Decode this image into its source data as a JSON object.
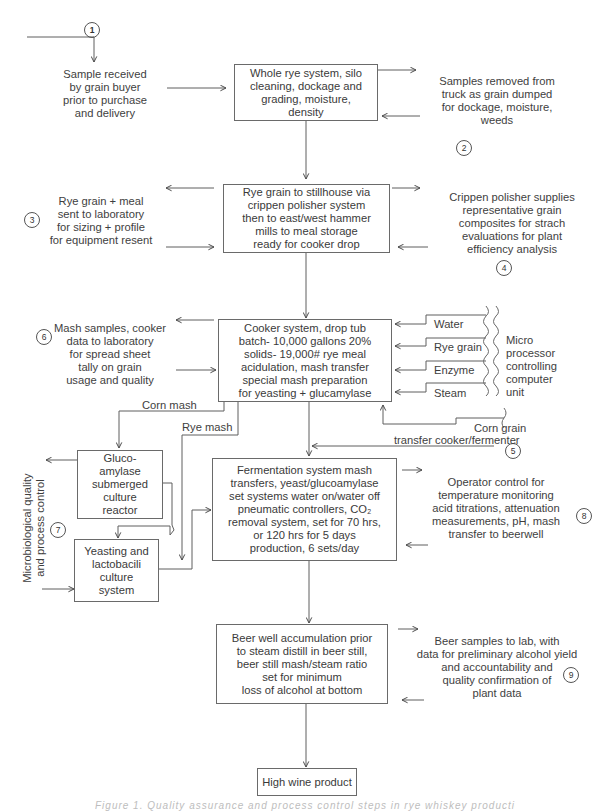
{
  "diagram": {
    "type": "process-flowchart",
    "markers": [
      "1",
      "2",
      "3",
      "4",
      "5",
      "6",
      "7",
      "8",
      "9"
    ],
    "boxes": {
      "whole_rye": "Whole rye system, silo\ncleaning, dockage and\ngrading, moisture,\ndensity",
      "rye_to_stillhouse": "Rye grain to stillhouse via\ncrippen polisher system\nthen to east/west hammer\nmills to meal storage\nready for cooker drop",
      "cooker": "Cooker system, drop tub\nbatch- 10,000 gallons 20%\nsolids- 19,000# rye meal\nacidulation, mash transfer\nspecial mash preparation\nfor yeasting + glucamylase",
      "glucoamylase": "Gluco-\namylase\nsubmerged\nculture\nreactor",
      "yeasting": "Yeasting and\nlactobacili\nculture\nsystem",
      "fermentation": "Fermentation system mash\ntransfers, yeast/glucoamylase\nset systems water on/water off\npneumatic controllers, CO₂\nremoval system, set for 70 hrs,\nor 120 hrs for 5 days\nproduction, 6 sets/day",
      "beer_well": "Beer well accumulation prior\nto steam distill in beer still,\nbeer still mash/steam ratio\nset for minimum\nloss of alcohol at bottom",
      "high_wine": "High wine product"
    },
    "notes": {
      "sample_received": "Sample received\nby grain buyer\nprior to purchase\nand delivery",
      "samples_removed": "Samples removed from\ntruck as grain dumped\nfor dockage, moisture,\nweeds",
      "rye_grain_meal": "Rye grain + meal\nsent to laboratory\nfor sizing + profile\nfor equipment resent",
      "crippen_polisher": "Crippen polisher supplies\nrepresentative grain\ncomposites for strach\nevaluations for plant\nefficiency analysis",
      "mash_samples": "Mash samples, cooker\ndata to laboratory\nfor spread sheet\ntally on grain\nusage and quality",
      "microbiological": "Microbiological quality\nand process control",
      "operator_control": "Operator control for\ntemperature monitoring\nacid titrations, attenuation\nmeasurements, pH, mash\ntransfer to beerwell",
      "beer_samples": "Beer samples to lab, with\ndata for preliminary alcohol yield\nand accountability and\nquality confirmation of\nplant data",
      "micro_processor": "Micro\nprocessor\ncontrolling\ncomputer\nunit"
    },
    "inputs": {
      "water": "Water",
      "rye_grain": "Rye grain",
      "enzyme": "Enzyme",
      "steam": "Steam",
      "corn_grain": "Corn grain",
      "transfer": "transfer cooker/fermenter",
      "corn_mash": "Corn mash",
      "rye_mash": "Rye mash"
    },
    "caption": "Figure 1.  Quality assurance and process control steps in rye whiskey production."
  },
  "colors": {
    "line": "#5a5a5a",
    "text": "#3a3a3a",
    "background": "#ffffff"
  }
}
